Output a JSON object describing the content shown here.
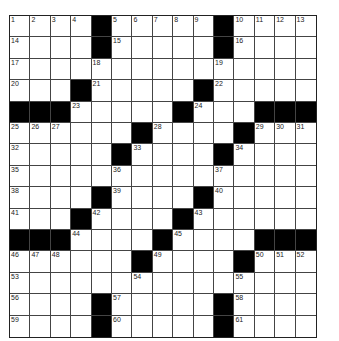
{
  "puzzle": {
    "rows": 15,
    "cols": 15,
    "layout": [
      "....#.....#....",
      "....#.....#....",
      "...............",
      "...#.....#.....",
      "###.....#...###",
      "......#....#...",
      ".....#....#....",
      "...............",
      "....#....#.....",
      "...#....#......",
      "###....#....###",
      "......#....#...",
      "...............",
      "....#.....#....",
      "....#.....#...."
    ],
    "numbers": [
      {
        "r": 0,
        "c": 0,
        "n": "1"
      },
      {
        "r": 0,
        "c": 1,
        "n": "2"
      },
      {
        "r": 0,
        "c": 2,
        "n": "3"
      },
      {
        "r": 0,
        "c": 3,
        "n": "4"
      },
      {
        "r": 0,
        "c": 5,
        "n": "5"
      },
      {
        "r": 0,
        "c": 6,
        "n": "6"
      },
      {
        "r": 0,
        "c": 7,
        "n": "7"
      },
      {
        "r": 0,
        "c": 8,
        "n": "8"
      },
      {
        "r": 0,
        "c": 9,
        "n": "9"
      },
      {
        "r": 0,
        "c": 11,
        "n": "10"
      },
      {
        "r": 0,
        "c": 12,
        "n": "11"
      },
      {
        "r": 0,
        "c": 13,
        "n": "12"
      },
      {
        "r": 0,
        "c": 14,
        "n": "13"
      },
      {
        "r": 1,
        "c": 0,
        "n": "14"
      },
      {
        "r": 1,
        "c": 5,
        "n": "15"
      },
      {
        "r": 1,
        "c": 11,
        "n": "16"
      },
      {
        "r": 2,
        "c": 0,
        "n": "17"
      },
      {
        "r": 2,
        "c": 4,
        "n": "18"
      },
      {
        "r": 2,
        "c": 10,
        "n": "19"
      },
      {
        "r": 3,
        "c": 0,
        "n": "20"
      },
      {
        "r": 3,
        "c": 4,
        "n": "21"
      },
      {
        "r": 3,
        "c": 10,
        "n": "22"
      },
      {
        "r": 4,
        "c": 3,
        "n": "23"
      },
      {
        "r": 4,
        "c": 9,
        "n": "24"
      },
      {
        "r": 5,
        "c": 0,
        "n": "25"
      },
      {
        "r": 5,
        "c": 1,
        "n": "26"
      },
      {
        "r": 5,
        "c": 2,
        "n": "27"
      },
      {
        "r": 5,
        "c": 7,
        "n": "28"
      },
      {
        "r": 5,
        "c": 12,
        "n": "29"
      },
      {
        "r": 5,
        "c": 13,
        "n": "30"
      },
      {
        "r": 5,
        "c": 14,
        "n": "31"
      },
      {
        "r": 6,
        "c": 0,
        "n": "32"
      },
      {
        "r": 6,
        "c": 6,
        "n": "33"
      },
      {
        "r": 6,
        "c": 11,
        "n": "34"
      },
      {
        "r": 7,
        "c": 0,
        "n": "35"
      },
      {
        "r": 7,
        "c": 5,
        "n": "36"
      },
      {
        "r": 7,
        "c": 10,
        "n": "37"
      },
      {
        "r": 8,
        "c": 0,
        "n": "38"
      },
      {
        "r": 8,
        "c": 5,
        "n": "39"
      },
      {
        "r": 8,
        "c": 10,
        "n": "40"
      },
      {
        "r": 9,
        "c": 0,
        "n": "41"
      },
      {
        "r": 9,
        "c": 4,
        "n": "42"
      },
      {
        "r": 9,
        "c": 9,
        "n": "43"
      },
      {
        "r": 10,
        "c": 3,
        "n": "44"
      },
      {
        "r": 10,
        "c": 8,
        "n": "45"
      },
      {
        "r": 11,
        "c": 0,
        "n": "46"
      },
      {
        "r": 11,
        "c": 1,
        "n": "47"
      },
      {
        "r": 11,
        "c": 2,
        "n": "48"
      },
      {
        "r": 11,
        "c": 7,
        "n": "49"
      },
      {
        "r": 11,
        "c": 12,
        "n": "50"
      },
      {
        "r": 11,
        "c": 13,
        "n": "51"
      },
      {
        "r": 11,
        "c": 14,
        "n": "52"
      },
      {
        "r": 12,
        "c": 0,
        "n": "53"
      },
      {
        "r": 12,
        "c": 6,
        "n": "54"
      },
      {
        "r": 12,
        "c": 11,
        "n": "55"
      },
      {
        "r": 13,
        "c": 0,
        "n": "56"
      },
      {
        "r": 13,
        "c": 5,
        "n": "57"
      },
      {
        "r": 13,
        "c": 11,
        "n": "58"
      },
      {
        "r": 14,
        "c": 0,
        "n": "59"
      },
      {
        "r": 14,
        "c": 5,
        "n": "60"
      },
      {
        "r": 14,
        "c": 11,
        "n": "61"
      }
    ],
    "colors": {
      "block": "#000000",
      "cell": "#ffffff",
      "line": "#444444"
    }
  }
}
